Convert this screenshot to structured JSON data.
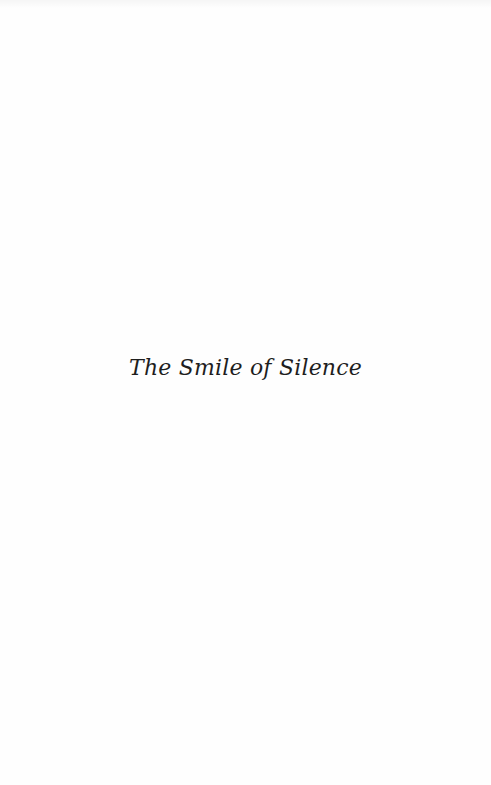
{
  "page": {
    "title": "The Smile of Silence"
  }
}
